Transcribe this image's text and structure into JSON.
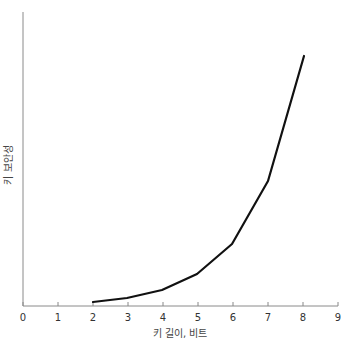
{
  "chart_data": {
    "type": "line",
    "title": "",
    "xlabel": "키 길이, 비트",
    "ylabel": "키 보안성",
    "x": [
      2,
      3,
      4,
      5,
      6,
      7,
      8
    ],
    "series": [
      {
        "name": "키 보안성",
        "values": [
          1,
          2,
          4,
          8,
          16,
          32,
          64
        ]
      }
    ],
    "xlim": [
      0,
      9
    ],
    "xticks": [
      0,
      1,
      2,
      3,
      4,
      5,
      6,
      7,
      8,
      9
    ],
    "yticks": [],
    "grid": false,
    "legend": "none",
    "line_color": "#111111",
    "axis_color": "#888888"
  },
  "layout": {
    "plot_left": 23,
    "plot_right": 338,
    "axis_y": 306,
    "axis_top": 12,
    "pixel_points": [
      [
        93,
        302
      ],
      [
        127,
        298
      ],
      [
        162,
        290
      ],
      [
        197,
        274
      ],
      [
        232,
        244
      ],
      [
        268,
        181
      ],
      [
        304,
        56
      ]
    ]
  }
}
